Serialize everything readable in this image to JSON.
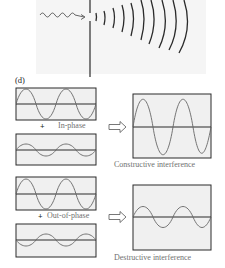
{
  "figure": {
    "part_label": "(d)",
    "diffraction": {
      "description": "Wave passing through slit, producing circular wavefronts",
      "incident_wave_icon": "wavy-arrow",
      "wavefront_count": 10
    },
    "panels": [
      {
        "id": "in-phase",
        "operator": "+",
        "phase_label": "In-phase",
        "result_label": "Constructive interference",
        "wave_a": {
          "amplitude": "large",
          "cycles": 2
        },
        "wave_b": {
          "amplitude": "small",
          "cycles": 2
        },
        "result": {
          "amplitude": "larger",
          "cycles": 2
        }
      },
      {
        "id": "out-of-phase",
        "operator": "+",
        "phase_label": "Out-of-phase",
        "result_label": "Destructive interference",
        "wave_a": {
          "amplitude": "large",
          "cycles": 2
        },
        "wave_b": {
          "amplitude": "small",
          "cycles": 2
        },
        "result": {
          "amplitude": "small",
          "cycles": 2
        }
      }
    ],
    "colors": {
      "line": "#2a2a2a",
      "wave": "#666666",
      "box_fill": "#f0f0f0",
      "label": "#707070",
      "panel_bg": "#f5f5f5"
    }
  }
}
